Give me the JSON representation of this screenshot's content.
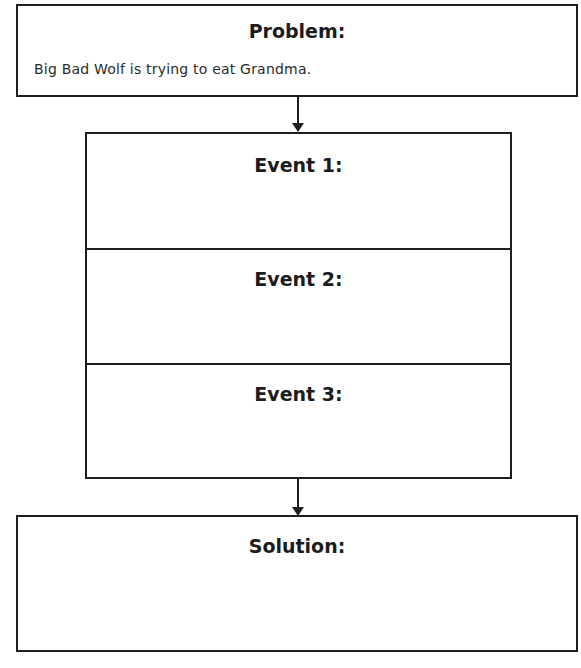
{
  "problem": {
    "heading": "Problem:",
    "answer": "Big Bad Wolf is trying to eat Grandma."
  },
  "events": [
    {
      "heading": "Event 1:",
      "answer": ""
    },
    {
      "heading": "Event 2:",
      "answer": ""
    },
    {
      "heading": "Event 3:",
      "answer": ""
    }
  ],
  "solution": {
    "heading": "Solution:",
    "answer": ""
  }
}
